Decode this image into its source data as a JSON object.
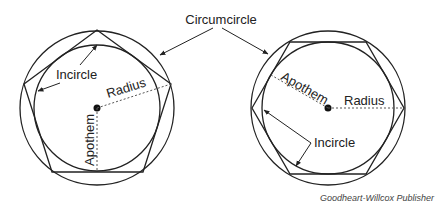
{
  "title_label": "Circumcircle",
  "left_figure": {
    "shape": "pentagon",
    "labels": {
      "incircle": "Incircle",
      "radius": "Radius",
      "apothem": "Apothem"
    }
  },
  "right_figure": {
    "shape": "hexagon",
    "labels": {
      "apothem": "Apothem",
      "radius": "Radius",
      "incircle": "Incircle"
    }
  },
  "credit": "Goodheart-Willcox Publisher",
  "colors": {
    "stroke": "#222222",
    "background": "#ffffff"
  }
}
